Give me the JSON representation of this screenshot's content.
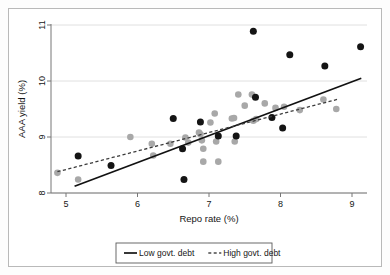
{
  "chart_data": {
    "type": "scatter",
    "title": "",
    "xlabel": "Repo rate (%)",
    "ylabel": "AAA yield (%)",
    "xlim": [
      4.75,
      9.2
    ],
    "ylim": [
      7.95,
      11.05
    ],
    "xticks": [
      5,
      6,
      7,
      8,
      9
    ],
    "xtick_labels": [
      "5",
      "6",
      "7",
      "8",
      "9"
    ],
    "yticks": [
      8,
      9,
      10,
      11
    ],
    "ytick_labels": [
      "8",
      "9",
      "10",
      "11"
    ],
    "grid": "horizontal",
    "legend_position": "bottom",
    "series": [
      {
        "name": "Low govt. debt",
        "marker": "filled-circle",
        "color": "#141414",
        "line_style": "solid",
        "points": [
          [
            5.17,
            8.66
          ],
          [
            5.63,
            8.49
          ],
          [
            6.5,
            9.33
          ],
          [
            6.63,
            8.79
          ],
          [
            6.65,
            8.24
          ],
          [
            6.88,
            9.27
          ],
          [
            7.13,
            9.02
          ],
          [
            7.38,
            9.02
          ],
          [
            7.62,
            10.89
          ],
          [
            7.65,
            9.71
          ],
          [
            7.88,
            9.35
          ],
          [
            8.03,
            9.16
          ],
          [
            8.13,
            10.47
          ],
          [
            8.62,
            10.27
          ],
          [
            9.12,
            10.61
          ]
        ],
        "fit_line": {
          "x0": 5.12,
          "y0": 8.12,
          "x1": 9.13,
          "y1": 10.05
        }
      },
      {
        "name": "High govt. debt",
        "marker": "filled-circle",
        "color": "#a8a8a8",
        "line_style": "dashed",
        "points": [
          [
            4.88,
            8.36
          ],
          [
            5.17,
            8.24
          ],
          [
            5.9,
            9.0
          ],
          [
            6.2,
            8.88
          ],
          [
            6.22,
            8.67
          ],
          [
            6.46,
            8.88
          ],
          [
            6.67,
            8.99
          ],
          [
            6.71,
            8.9
          ],
          [
            6.86,
            9.08
          ],
          [
            6.88,
            9.05
          ],
          [
            6.9,
            8.94
          ],
          [
            6.92,
            8.79
          ],
          [
            6.92,
            8.56
          ],
          [
            7.02,
            9.26
          ],
          [
            7.08,
            9.42
          ],
          [
            7.1,
            8.92
          ],
          [
            7.13,
            8.56
          ],
          [
            7.32,
            9.33
          ],
          [
            7.35,
            9.34
          ],
          [
            7.36,
            8.92
          ],
          [
            7.41,
            9.76
          ],
          [
            7.5,
            9.56
          ],
          [
            7.6,
            9.76
          ],
          [
            7.62,
            9.29
          ],
          [
            7.66,
            9.32
          ],
          [
            7.78,
            9.6
          ],
          [
            7.93,
            9.52
          ],
          [
            8.05,
            9.54
          ],
          [
            8.27,
            9.48
          ],
          [
            8.6,
            9.67
          ],
          [
            8.78,
            9.5
          ]
        ],
        "fit_line": {
          "x0": 4.88,
          "y0": 8.38,
          "x1": 8.82,
          "y1": 9.68
        }
      }
    ],
    "legend": [
      {
        "label": "Low govt. debt",
        "style": "solid",
        "color": "#141414"
      },
      {
        "label": "High govt. debt",
        "style": "dashed",
        "color": "#4a4a4a"
      }
    ]
  }
}
